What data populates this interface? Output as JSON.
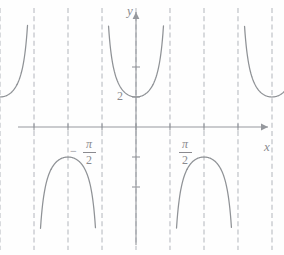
{
  "figure": {
    "title": "",
    "axis_labels": {
      "x": "x",
      "y": "y"
    },
    "y_tick_labels": [
      {
        "value": 2,
        "text": "2"
      }
    ],
    "x_tick_labels": [
      {
        "value": -1.5708,
        "text": "-pi/2",
        "minus": "−",
        "numerator": "π",
        "denominator": "2"
      },
      {
        "value": 1.5708,
        "text": "pi/2",
        "minus": "",
        "numerator": "π",
        "denominator": "2"
      }
    ]
  },
  "chart_data": {
    "type": "line",
    "title": "",
    "xlabel": "x",
    "ylabel": "y",
    "function": "y = 2 sec(2x)",
    "xlim": [
      -4.71,
      4.35
    ],
    "ylim": [
      -6.6,
      6.6
    ],
    "grid": false,
    "legend": null,
    "period": 3.1416,
    "amplitude_offset": 2,
    "asymptotes_x": [
      -3.927,
      -3.1416,
      -2.356,
      -1.5708,
      -0.785,
      0,
      0.785,
      1.5708,
      2.356,
      3.1416,
      3.927
    ],
    "series": [
      {
        "name": "2 sec(2x)",
        "branches": [
          {
            "center": -3.534,
            "extremum": 2,
            "direction": "up"
          },
          {
            "center": -2.749,
            "extremum": -2,
            "direction": "down"
          },
          {
            "center": -1.963,
            "extremum": 2,
            "direction": "up"
          },
          {
            "center": -1.178,
            "extremum": -2,
            "direction": "down"
          },
          {
            "center": -0.393,
            "extremum": 2,
            "direction": "up"
          },
          {
            "center": 0.393,
            "extremum": -2,
            "direction": "down"
          },
          {
            "center": 1.178,
            "extremum": 2,
            "direction": "up"
          },
          {
            "center": 1.963,
            "extremum": -2,
            "direction": "down"
          },
          {
            "center": 2.749,
            "extremum": 2,
            "direction": "up"
          },
          {
            "center": 3.534,
            "extremum": -2,
            "direction": "down"
          }
        ]
      }
    ],
    "annotations": [
      {
        "text": "2",
        "x": -0.22,
        "y": 2,
        "kind": "y-tick-label"
      },
      {
        "text": "−π/2",
        "x": -1.5708,
        "y": -0.9,
        "kind": "x-tick-label"
      },
      {
        "text": "π/2",
        "x": 1.5708,
        "y": -0.9,
        "kind": "x-tick-label"
      }
    ],
    "colors": {
      "curve": "#8f9296",
      "asymptote": "#b9bcc2",
      "axis": "#95989d",
      "text": "#8a8a8f",
      "background": "#fefefe"
    }
  }
}
